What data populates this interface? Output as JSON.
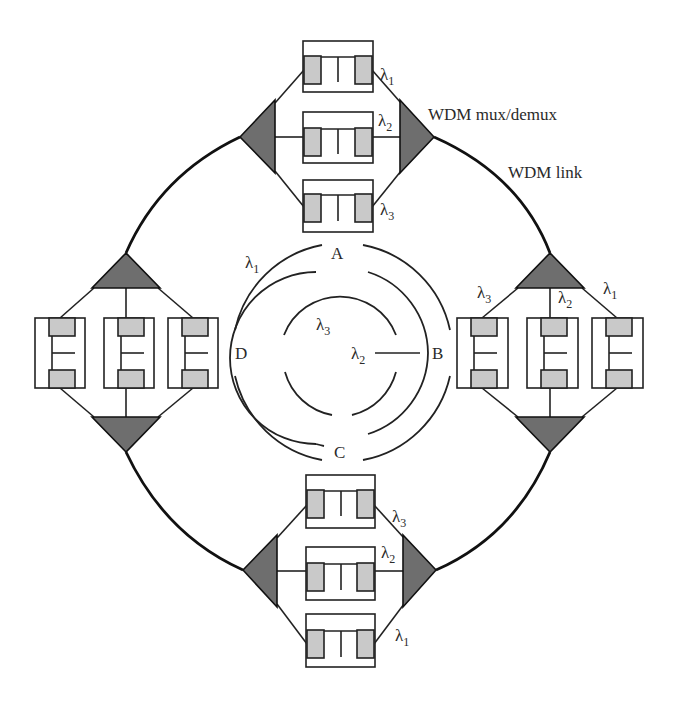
{
  "figure": {
    "labels": {
      "mux_demux": "WDM mux/demux",
      "link": "WDM link"
    },
    "wavelengths": {
      "l1": "λ",
      "l1_sub": "1",
      "l2": "λ",
      "l2_sub": "2",
      "l3": "λ",
      "l3_sub": "3"
    },
    "nodes": {
      "top": {
        "channels": [
          "λ1",
          "λ2",
          "λ3"
        ]
      },
      "right": {
        "channels": [
          "λ3",
          "λ2",
          "λ1"
        ]
      },
      "bottom": {
        "channels": [
          "λ3",
          "λ2",
          "λ1"
        ]
      },
      "left": {
        "channels": [
          "",
          "",
          ""
        ]
      }
    },
    "logical_ring": {
      "node_labels": {
        "a": "A",
        "b": "B",
        "c": "C",
        "d": "D"
      },
      "rings": [
        {
          "name": "outer",
          "wavelength": "λ1"
        },
        {
          "name": "middle",
          "wavelength": "λ2"
        },
        {
          "name": "inner",
          "wavelength": "λ3"
        }
      ]
    },
    "colors": {
      "mux_fill": "#6e6e6e",
      "block_fill": "#c9c9c9",
      "line": "#222222"
    }
  }
}
